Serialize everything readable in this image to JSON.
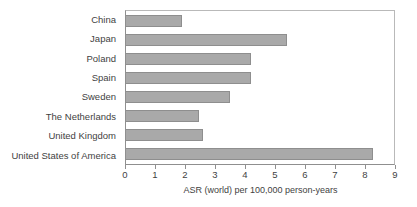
{
  "chart_data": {
    "type": "bar",
    "orientation": "horizontal",
    "title": "",
    "xlabel": "ASR (world) per 100,000 person-years",
    "ylabel": "",
    "xlim": [
      0,
      9
    ],
    "xticks": [
      0,
      1,
      2,
      3,
      4,
      5,
      6,
      7,
      8,
      9
    ],
    "xtick_labels": [
      "0",
      "1",
      "2",
      "3",
      "4",
      "5",
      "6",
      "7",
      "8",
      "9"
    ],
    "grid": false,
    "legend": null,
    "categories": [
      "China",
      "Japan",
      "Poland",
      "Spain",
      "Sweden",
      "The Netherlands",
      "United Kingdom",
      "United States of America"
    ],
    "values": [
      1.88,
      5.35,
      4.15,
      4.15,
      3.48,
      2.43,
      2.57,
      8.23
    ],
    "bars": [
      {
        "label": "China",
        "value": 1.88
      },
      {
        "label": "Japan",
        "value": 5.35
      },
      {
        "label": "Poland",
        "value": 4.15
      },
      {
        "label": "Spain",
        "value": 4.15
      },
      {
        "label": "Sweden",
        "value": 3.48
      },
      {
        "label": "The Netherlands",
        "value": 2.43
      },
      {
        "label": "United Kingdom",
        "value": 2.57
      },
      {
        "label": "United States of America",
        "value": 8.23
      }
    ],
    "colors": {
      "bar_fill": "#a9a9a9",
      "bar_edge": "#8e8e8e",
      "axis_line": "#8f8f8f",
      "frame_line": "#b9b9b9",
      "text": "#3f3f3f",
      "background": "#ffffff"
    }
  }
}
